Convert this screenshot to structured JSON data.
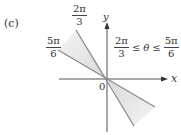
{
  "figure": {
    "panel_label": "(c)",
    "axis_x_label": "x",
    "axis_y_label": "y",
    "origin_label": "0",
    "angle_label_upper": {
      "num": "2π",
      "den": "3"
    },
    "angle_label_left": {
      "num": "5π",
      "den": "6"
    },
    "inequality": {
      "left": {
        "num": "2π",
        "den": "3"
      },
      "op1": "≤",
      "var": "θ",
      "op2": "≤",
      "right": {
        "num": "5π",
        "den": "6"
      }
    },
    "colors": {
      "axis": "#555555",
      "ray": "#8a8a8a",
      "shade": "#e6e6e6"
    }
  }
}
